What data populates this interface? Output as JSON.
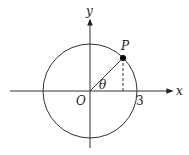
{
  "diagram": {
    "type": "unit-circle-style diagram",
    "labels": {
      "x_axis": "x",
      "y_axis": "y",
      "origin": "O",
      "point": "P",
      "angle": "θ",
      "radius_tick": "3"
    },
    "circle": {
      "center": [
        0,
        0
      ],
      "radius": 3
    },
    "point_P": {
      "on_circle": true,
      "angle_label": "θ",
      "dashed_projection_to_x_axis": true
    },
    "colors": {
      "stroke": "#333333",
      "point_fill": "#000000",
      "background": "#ffffff"
    }
  }
}
